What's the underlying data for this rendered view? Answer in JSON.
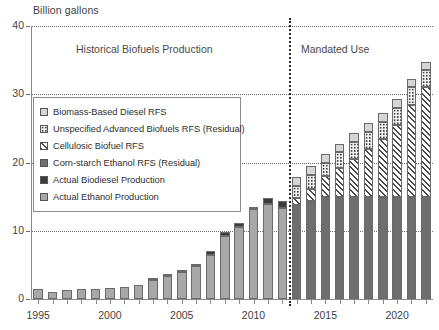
{
  "chart_data": {
    "type": "bar",
    "title": "",
    "ylabel": "Billion gallons",
    "xlabel": "",
    "ylim": [
      0,
      40
    ],
    "yticks": [
      0,
      10,
      20,
      30,
      40
    ],
    "xticks_labeled": [
      1995,
      2000,
      2005,
      2010,
      2015,
      2020
    ],
    "grid": true,
    "legend_position": "inside-left",
    "stacked": true,
    "annotations": [
      {
        "text": "Historical Biofuels Production",
        "x": 2003.5,
        "y": 38
      },
      {
        "text": "Mandated Use",
        "x": 2016.5,
        "y": 38
      },
      {
        "text": "divider",
        "x": 2012.5,
        "type": "vertical-dotted-line"
      }
    ],
    "categories": [
      1995,
      1996,
      1997,
      1998,
      1999,
      2000,
      2001,
      2002,
      2003,
      2004,
      2005,
      2006,
      2007,
      2008,
      2009,
      2010,
      2011,
      2012,
      2013,
      2014,
      2015,
      2016,
      2017,
      2018,
      2019,
      2020,
      2021,
      2022
    ],
    "series": [
      {
        "name": "Actual Ethanol Production",
        "key": "actual_ethanol",
        "values": [
          1.4,
          1.1,
          1.3,
          1.4,
          1.5,
          1.6,
          1.8,
          2.1,
          2.8,
          3.4,
          3.9,
          4.9,
          6.5,
          9.2,
          10.6,
          13.2,
          13.9,
          13.3,
          null,
          null,
          null,
          null,
          null,
          null,
          null,
          null,
          null,
          null
        ]
      },
      {
        "name": "Actual Biodiesel Production",
        "key": "actual_biodiesel",
        "values": [
          0,
          0,
          0,
          0,
          0,
          0,
          0,
          0,
          0.03,
          0.03,
          0.09,
          0.25,
          0.49,
          0.68,
          0.5,
          0.34,
          0.97,
          1.1,
          null,
          null,
          null,
          null,
          null,
          null,
          null,
          null,
          null,
          null
        ]
      },
      {
        "name": "Corn-starch Ethanol RFS (Residual)",
        "key": "corn_rfs",
        "values": [
          null,
          null,
          null,
          null,
          null,
          null,
          null,
          null,
          null,
          null,
          null,
          null,
          null,
          null,
          null,
          null,
          null,
          null,
          13.8,
          14.4,
          15.0,
          15.0,
          15.0,
          15.0,
          15.0,
          15.0,
          15.0,
          15.0
        ]
      },
      {
        "name": "Cellulosic Biofuel RFS",
        "key": "cellulosic_rfs",
        "values": [
          null,
          null,
          null,
          null,
          null,
          null,
          null,
          null,
          null,
          null,
          null,
          null,
          null,
          null,
          null,
          null,
          null,
          null,
          1.0,
          1.75,
          3.0,
          4.25,
          5.5,
          7.0,
          8.5,
          10.5,
          13.5,
          16.0
        ]
      },
      {
        "name": "Unspecified Advanced Biofuels RFS (Residual)",
        "key": "unspec_advanced",
        "values": [
          null,
          null,
          null,
          null,
          null,
          null,
          null,
          null,
          null,
          null,
          null,
          null,
          null,
          null,
          null,
          null,
          null,
          null,
          1.75,
          2.0,
          2.0,
          2.25,
          2.5,
          2.5,
          2.5,
          2.5,
          2.5,
          2.5
        ]
      },
      {
        "name": "Biomass-Based Diesel RFS",
        "key": "biomass_diesel_rfs",
        "values": [
          null,
          null,
          null,
          null,
          null,
          null,
          null,
          null,
          null,
          null,
          null,
          null,
          null,
          null,
          null,
          null,
          null,
          null,
          1.28,
          1.28,
          1.28,
          1.28,
          1.28,
          1.28,
          1.28,
          1.28,
          1.28,
          1.28
        ]
      }
    ]
  },
  "axes": {
    "y_label_text": "Billion gallons",
    "y_tick_labels": [
      "40",
      "30",
      "20",
      "10",
      "0"
    ],
    "x_tick_labels": [
      "1995",
      "2000",
      "2005",
      "2010",
      "2015",
      "2020"
    ]
  },
  "regions": {
    "historical": "Historical Biofuels Production",
    "mandated": "Mandated Use"
  },
  "legend": {
    "items": [
      {
        "label": "Biomass-Based Diesel RFS",
        "swatch": "biomass-diesel-swatch",
        "color": "#d6d6d6"
      },
      {
        "label": "Unspecified Advanced Biofuels RFS (Residual)",
        "swatch": "unspecified-advanced-swatch",
        "color": "#f2f2f2"
      },
      {
        "label": "Cellulosic Biofuel RFS",
        "swatch": "cellulosic-swatch",
        "color": "#fdfdfd"
      },
      {
        "label": "Corn-starch Ethanol RFS (Residual)",
        "swatch": "corn-starch-swatch",
        "color": "#6e6e6e"
      },
      {
        "label": "Actual Biodiesel Production",
        "swatch": "actual-biodiesel-swatch",
        "color": "#3c3c3c"
      },
      {
        "label": "Actual Ethanol Production",
        "swatch": "actual-ethanol-swatch",
        "color": "#a8a8a8"
      }
    ]
  },
  "colors": {
    "ethanol": "#a8a8a8",
    "biodiesel": "#3c3c3c",
    "corn": "#6e6e6e",
    "cellulosic": "#fdfdfd",
    "unspecified": "#f2f2f2",
    "biomass_diesel": "#d6d6d6"
  }
}
